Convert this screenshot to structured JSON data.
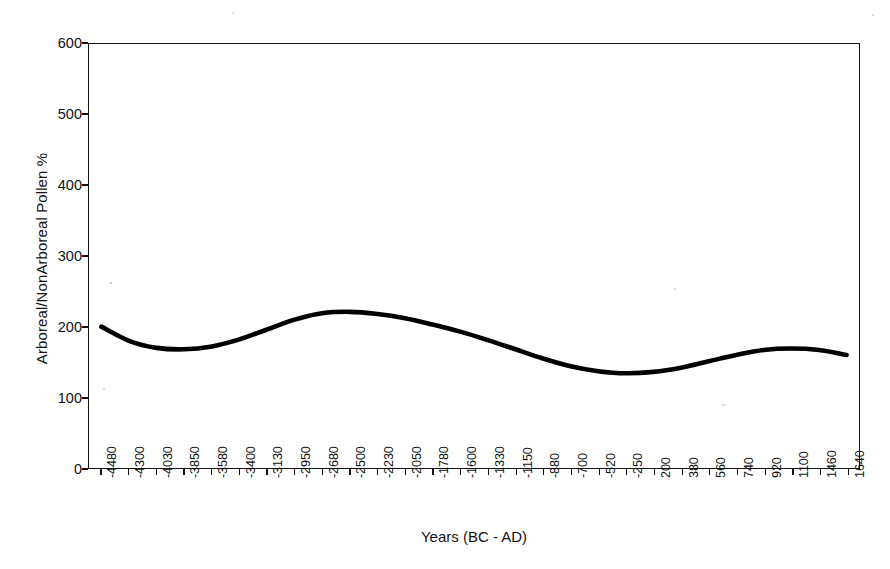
{
  "chart_data": {
    "type": "line",
    "title": "",
    "xlabel": "Years (BC - AD)",
    "ylabel": "Arboreal/NonArboreal Pollen %",
    "ylim": [
      0,
      600
    ],
    "ytick_values": [
      0,
      100,
      200,
      300,
      400,
      500,
      600
    ],
    "ytick_labels": [
      "0",
      "100",
      "200",
      "300",
      "400",
      "500",
      "600"
    ],
    "grid": false,
    "legend": false,
    "legend_position": "none",
    "categories": [
      "-4480",
      "-4300",
      "-4030",
      "-3850",
      "-3580",
      "-3400",
      "-3130",
      "-2950",
      "-2680",
      "-2500",
      "-2230",
      "-2050",
      "-1780",
      "-1600",
      "-1330",
      "-1150",
      "-880",
      "-700",
      "-520",
      "-250",
      "200",
      "380",
      "560",
      "740",
      "920",
      "1100",
      "1460",
      "1640"
    ],
    "series": [
      {
        "name": "Arboreal/NonArboreal Pollen %",
        "color": "#000000",
        "line_width": 4,
        "values": [
          200,
          180,
          170,
          168,
          172,
          182,
          196,
          210,
          219,
          221,
          218,
          212,
          203,
          193,
          181,
          168,
          155,
          144,
          137,
          134,
          136,
          142,
          151,
          160,
          167,
          169,
          167,
          160
        ]
      }
    ]
  }
}
